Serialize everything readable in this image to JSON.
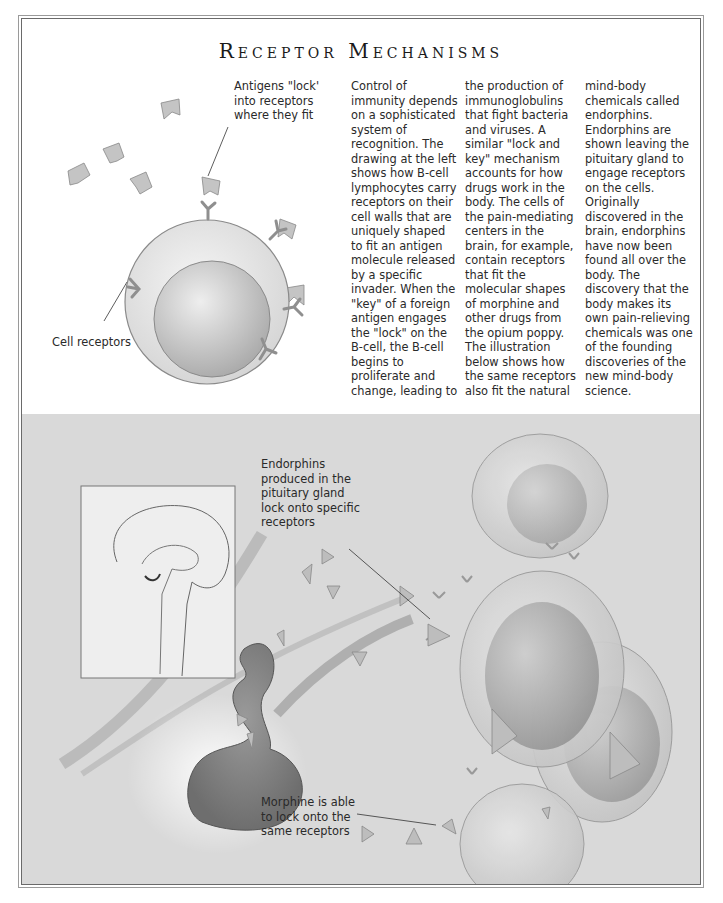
{
  "page": {
    "title": "Receptor Mechanisms",
    "top_labels": {
      "antigens": "Antigens \"lock'\ninto receptors\nwhere they fit",
      "cell_receptors": "Cell receptors"
    },
    "columns": [
      "Control of\nimmunity depends\non a sophisticated\nsystem of\nrecognition. The\ndrawing at the left\nshows how B-cell\nlymphocytes carry\nreceptors on their\ncell walls that are\nuniquely shaped\nto fit an antigen\nmolecule released\nby a specific\ninvader. When the\n\"key\" of a foreign\nantigen engages\nthe \"lock\" on the\nB-cell, the B-cell\nbegins to\nproliferate and\nchange, leading to",
      "the production of\nimmunoglobulins\nthat fight bacteria\nand viruses. A\nsimilar \"lock and\nkey\" mechanism\naccounts for how\ndrugs work in the\nbody. The cells of\nthe pain-mediating\ncenters in the\nbrain, for example,\ncontain receptors\nthat fit the\nmolecular shapes\nof morphine and\nother drugs from\nthe opium poppy.\nThe illustration\nbelow shows how\nthe same receptors\nalso fit the natural",
      "mind-body\nchemicals called\nendorphins.\nEndorphins are\nshown leaving the\npituitary gland to\nengage receptors\non the cells.\nOriginally\ndiscovered in the\nbrain, endorphins\nhave now been\nfound all over the\nbody. The\ndiscovery that the\nbody makes its\nown pain-relieving\nchemicals was one\nof the founding\ndiscoveries of the\nnew mind-body\nscience."
    ],
    "bottom_labels": {
      "endorphins": "Endorphins\nproduced in the\npituitary gland\nlock onto specific\nreceptors",
      "morphine": "Morphine is able\nto lock onto the\nsame receptors"
    },
    "colors": {
      "illustration_bg": "#d9d9d9",
      "cell_fill": "#e8e8e8",
      "nucleus_fill": "#bdbdbd",
      "receptor": "#8f8f8f"
    }
  }
}
